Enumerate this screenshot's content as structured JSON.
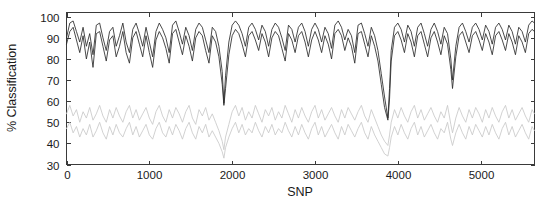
{
  "chart_data": {
    "type": "line",
    "title": "",
    "xlabel": "SNP",
    "ylabel": "% Classification",
    "xlim": [
      0,
      5650
    ],
    "ylim": [
      30,
      102
    ],
    "xticks": [
      0,
      1000,
      2000,
      3000,
      4000,
      5000
    ],
    "xticklabels": [
      "0",
      "1000",
      "2000",
      "3000",
      "4000",
      "5000"
    ],
    "yticks": [
      30,
      40,
      50,
      60,
      70,
      80,
      90,
      100
    ],
    "yticklabels": [
      "30",
      "40",
      "50",
      "60",
      "70",
      "80",
      "90",
      "100"
    ],
    "grid": false,
    "legend": null,
    "colors": {
      "dark": "#2b2b2b",
      "gray": "#c9c9c9",
      "axis": "#3a3a3a",
      "text": "#1a1a1a",
      "background": "#ffffff"
    },
    "series": [
      {
        "name": "upper-dark-line",
        "color": "#2b2b2b",
        "x": [
          0,
          40,
          80,
          120,
          160,
          200,
          240,
          280,
          320,
          360,
          400,
          440,
          480,
          520,
          560,
          600,
          640,
          680,
          720,
          760,
          800,
          840,
          880,
          920,
          960,
          1000,
          1040,
          1080,
          1120,
          1160,
          1200,
          1240,
          1280,
          1320,
          1360,
          1400,
          1440,
          1480,
          1520,
          1560,
          1600,
          1640,
          1680,
          1720,
          1760,
          1800,
          1840,
          1880,
          1900,
          1920,
          1960,
          2000,
          2040,
          2080,
          2120,
          2160,
          2200,
          2240,
          2280,
          2320,
          2360,
          2400,
          2440,
          2480,
          2520,
          2560,
          2600,
          2640,
          2680,
          2720,
          2760,
          2800,
          2840,
          2880,
          2920,
          2960,
          3000,
          3040,
          3080,
          3120,
          3160,
          3200,
          3240,
          3280,
          3320,
          3360,
          3400,
          3440,
          3480,
          3520,
          3560,
          3600,
          3640,
          3680,
          3720,
          3760,
          3800,
          3840,
          3880,
          3900,
          3920,
          3960,
          4000,
          4040,
          4080,
          4120,
          4160,
          4200,
          4240,
          4280,
          4320,
          4360,
          4400,
          4440,
          4480,
          4520,
          4560,
          4600,
          4640,
          4660,
          4700,
          4740,
          4780,
          4820,
          4860,
          4900,
          4940,
          4980,
          5020,
          5060,
          5100,
          5140,
          5180,
          5220,
          5260,
          5300,
          5340,
          5380,
          5420,
          5460,
          5500,
          5540,
          5580,
          5620,
          5650
        ],
        "y": [
          90,
          97,
          98,
          93,
          88,
          95,
          86,
          92,
          82,
          96,
          97,
          90,
          84,
          93,
          95,
          86,
          91,
          97,
          88,
          83,
          94,
          97,
          92,
          86,
          95,
          88,
          81,
          93,
          97,
          94,
          90,
          83,
          96,
          98,
          93,
          87,
          95,
          91,
          84,
          94,
          97,
          95,
          89,
          83,
          95,
          93,
          86,
          74,
          59,
          72,
          88,
          96,
          98,
          96,
          92,
          86,
          95,
          97,
          94,
          89,
          96,
          93,
          86,
          94,
          97,
          95,
          90,
          84,
          96,
          94,
          88,
          95,
          97,
          93,
          86,
          94,
          97,
          94,
          88,
          95,
          92,
          85,
          96,
          98,
          95,
          89,
          94,
          91,
          83,
          96,
          97,
          92,
          86,
          95,
          91,
          84,
          73,
          62,
          52,
          66,
          84,
          95,
          97,
          94,
          88,
          96,
          93,
          86,
          95,
          97,
          92,
          86,
          94,
          97,
          93,
          87,
          95,
          92,
          80,
          70,
          86,
          95,
          97,
          93,
          88,
          95,
          97,
          94,
          89,
          96,
          93,
          87,
          95,
          97,
          94,
          89,
          96,
          93,
          87,
          95,
          93,
          88,
          96,
          98,
          97
        ]
      },
      {
        "name": "lower-dark-line",
        "color": "#2b2b2b",
        "x": [
          0,
          40,
          80,
          120,
          160,
          200,
          240,
          280,
          320,
          360,
          400,
          440,
          480,
          520,
          560,
          600,
          640,
          680,
          720,
          760,
          800,
          840,
          880,
          920,
          960,
          1000,
          1040,
          1080,
          1120,
          1160,
          1200,
          1240,
          1280,
          1320,
          1360,
          1400,
          1440,
          1480,
          1520,
          1560,
          1600,
          1640,
          1680,
          1720,
          1760,
          1800,
          1840,
          1880,
          1900,
          1920,
          1960,
          2000,
          2040,
          2080,
          2120,
          2160,
          2200,
          2240,
          2280,
          2320,
          2360,
          2400,
          2440,
          2480,
          2520,
          2560,
          2600,
          2640,
          2680,
          2720,
          2760,
          2800,
          2840,
          2880,
          2920,
          2960,
          3000,
          3040,
          3080,
          3120,
          3160,
          3200,
          3240,
          3280,
          3320,
          3360,
          3400,
          3440,
          3480,
          3520,
          3560,
          3600,
          3640,
          3680,
          3720,
          3760,
          3800,
          3840,
          3880,
          3900,
          3920,
          3960,
          4000,
          4040,
          4080,
          4120,
          4160,
          4200,
          4240,
          4280,
          4320,
          4360,
          4400,
          4440,
          4480,
          4520,
          4560,
          4600,
          4640,
          4660,
          4700,
          4740,
          4780,
          4820,
          4860,
          4900,
          4940,
          4980,
          5020,
          5060,
          5100,
          5140,
          5180,
          5220,
          5260,
          5300,
          5340,
          5380,
          5420,
          5460,
          5500,
          5540,
          5580,
          5620,
          5650
        ],
        "y": [
          87,
          93,
          95,
          89,
          83,
          91,
          80,
          88,
          76,
          92,
          93,
          86,
          79,
          89,
          91,
          81,
          86,
          93,
          83,
          78,
          90,
          93,
          87,
          81,
          91,
          83,
          76,
          89,
          93,
          90,
          85,
          78,
          92,
          94,
          88,
          82,
          91,
          86,
          79,
          90,
          93,
          91,
          84,
          78,
          91,
          88,
          81,
          68,
          58,
          66,
          82,
          91,
          94,
          92,
          87,
          81,
          91,
          93,
          89,
          84,
          92,
          88,
          81,
          90,
          93,
          91,
          85,
          79,
          92,
          89,
          83,
          91,
          93,
          88,
          81,
          89,
          93,
          89,
          83,
          91,
          87,
          80,
          92,
          94,
          91,
          84,
          90,
          86,
          78,
          92,
          93,
          87,
          81,
          91,
          86,
          79,
          68,
          57,
          51,
          61,
          79,
          91,
          93,
          89,
          83,
          92,
          88,
          81,
          91,
          93,
          87,
          81,
          90,
          93,
          88,
          82,
          91,
          87,
          75,
          66,
          81,
          91,
          93,
          88,
          83,
          91,
          93,
          89,
          84,
          92,
          88,
          82,
          91,
          93,
          89,
          84,
          92,
          88,
          82,
          91,
          88,
          83,
          92,
          94,
          93
        ]
      },
      {
        "name": "upper-gray-line",
        "color": "#c9c9c9",
        "x": [
          0,
          40,
          80,
          120,
          160,
          200,
          240,
          280,
          320,
          360,
          400,
          440,
          480,
          520,
          560,
          600,
          640,
          680,
          720,
          760,
          800,
          840,
          880,
          920,
          960,
          1000,
          1040,
          1080,
          1120,
          1160,
          1200,
          1240,
          1280,
          1320,
          1360,
          1400,
          1440,
          1480,
          1520,
          1560,
          1600,
          1640,
          1680,
          1720,
          1760,
          1800,
          1840,
          1880,
          1900,
          1920,
          1960,
          2000,
          2040,
          2080,
          2120,
          2160,
          2200,
          2240,
          2280,
          2320,
          2360,
          2400,
          2440,
          2480,
          2520,
          2560,
          2600,
          2640,
          2680,
          2720,
          2760,
          2800,
          2840,
          2880,
          2920,
          2960,
          3000,
          3040,
          3080,
          3120,
          3160,
          3200,
          3240,
          3280,
          3320,
          3360,
          3400,
          3440,
          3480,
          3520,
          3560,
          3600,
          3640,
          3680,
          3720,
          3760,
          3800,
          3840,
          3880,
          3900,
          3920,
          3960,
          4000,
          4040,
          4080,
          4120,
          4160,
          4200,
          4240,
          4280,
          4320,
          4360,
          4400,
          4440,
          4480,
          4520,
          4560,
          4600,
          4640,
          4660,
          4700,
          4740,
          4780,
          4820,
          4860,
          4900,
          4940,
          4980,
          5020,
          5060,
          5100,
          5140,
          5180,
          5220,
          5260,
          5300,
          5340,
          5380,
          5420,
          5460,
          5500,
          5540,
          5580,
          5620,
          5650
        ],
        "y": [
          54,
          58,
          53,
          56,
          50,
          55,
          52,
          57,
          51,
          54,
          58,
          53,
          50,
          56,
          52,
          57,
          53,
          50,
          55,
          58,
          52,
          56,
          51,
          54,
          57,
          52,
          49,
          55,
          58,
          53,
          50,
          56,
          52,
          57,
          54,
          50,
          55,
          58,
          52,
          49,
          56,
          53,
          57,
          51,
          54,
          50,
          46,
          41,
          37,
          43,
          49,
          55,
          58,
          53,
          57,
          51,
          55,
          52,
          58,
          54,
          50,
          56,
          53,
          57,
          51,
          55,
          52,
          58,
          54,
          50,
          56,
          52,
          57,
          53,
          50,
          55,
          58,
          52,
          56,
          51,
          54,
          57,
          53,
          50,
          56,
          52,
          57,
          54,
          51,
          55,
          58,
          53,
          50,
          56,
          52,
          48,
          44,
          41,
          39,
          44,
          50,
          56,
          52,
          57,
          53,
          50,
          55,
          58,
          52,
          56,
          51,
          54,
          57,
          53,
          50,
          55,
          52,
          58,
          49,
          45,
          52,
          57,
          53,
          50,
          56,
          52,
          57,
          54,
          50,
          56,
          52,
          57,
          53,
          50,
          55,
          58,
          52,
          56,
          51,
          54,
          57,
          53,
          50,
          56,
          54
        ]
      },
      {
        "name": "lower-gray-line",
        "color": "#c9c9c9",
        "x": [
          0,
          40,
          80,
          120,
          160,
          200,
          240,
          280,
          320,
          360,
          400,
          440,
          480,
          520,
          560,
          600,
          640,
          680,
          720,
          760,
          800,
          840,
          880,
          920,
          960,
          1000,
          1040,
          1080,
          1120,
          1160,
          1200,
          1240,
          1280,
          1320,
          1360,
          1400,
          1440,
          1480,
          1520,
          1560,
          1600,
          1640,
          1680,
          1720,
          1760,
          1800,
          1840,
          1880,
          1900,
          1920,
          1960,
          2000,
          2040,
          2080,
          2120,
          2160,
          2200,
          2240,
          2280,
          2320,
          2360,
          2400,
          2440,
          2480,
          2520,
          2560,
          2600,
          2640,
          2680,
          2720,
          2760,
          2800,
          2840,
          2880,
          2920,
          2960,
          3000,
          3040,
          3080,
          3120,
          3160,
          3200,
          3240,
          3280,
          3320,
          3360,
          3400,
          3440,
          3480,
          3520,
          3560,
          3600,
          3640,
          3680,
          3720,
          3760,
          3800,
          3840,
          3880,
          3900,
          3920,
          3960,
          4000,
          4040,
          4080,
          4120,
          4160,
          4200,
          4240,
          4280,
          4320,
          4360,
          4400,
          4440,
          4480,
          4520,
          4560,
          4600,
          4640,
          4660,
          4700,
          4740,
          4780,
          4820,
          4860,
          4900,
          4940,
          4980,
          5020,
          5060,
          5100,
          5140,
          5180,
          5220,
          5260,
          5300,
          5340,
          5380,
          5420,
          5460,
          5500,
          5540,
          5580,
          5620,
          5650
        ],
        "y": [
          47,
          50,
          45,
          48,
          43,
          47,
          44,
          49,
          43,
          46,
          50,
          45,
          42,
          48,
          44,
          49,
          45,
          43,
          47,
          50,
          44,
          48,
          43,
          46,
          49,
          44,
          42,
          47,
          50,
          45,
          43,
          48,
          44,
          49,
          46,
          42,
          47,
          50,
          45,
          42,
          48,
          45,
          49,
          43,
          46,
          43,
          40,
          36,
          33,
          38,
          43,
          47,
          50,
          45,
          49,
          44,
          47,
          45,
          50,
          46,
          43,
          48,
          45,
          49,
          44,
          47,
          45,
          50,
          46,
          43,
          48,
          44,
          49,
          45,
          42,
          47,
          50,
          44,
          48,
          43,
          46,
          49,
          45,
          42,
          48,
          44,
          49,
          46,
          43,
          47,
          50,
          45,
          42,
          48,
          44,
          41,
          38,
          35,
          34,
          38,
          43,
          48,
          44,
          49,
          45,
          42,
          47,
          50,
          44,
          48,
          43,
          46,
          49,
          45,
          42,
          47,
          45,
          50,
          42,
          39,
          45,
          49,
          45,
          42,
          48,
          44,
          49,
          46,
          43,
          48,
          44,
          49,
          45,
          42,
          47,
          50,
          44,
          48,
          43,
          46,
          49,
          45,
          42,
          48,
          46
        ]
      }
    ]
  },
  "axes": {
    "ylabel_text": "% Classification",
    "xlabel_text": "SNP"
  }
}
